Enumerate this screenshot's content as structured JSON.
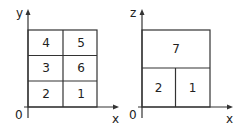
{
  "diagram": {
    "left_panel": {
      "vertical_axis_label": "y",
      "horizontal_axis_label": "x",
      "origin_label": "0",
      "cells": [
        {
          "label": "4",
          "row": 0,
          "col": 0
        },
        {
          "label": "5",
          "row": 0,
          "col": 1
        },
        {
          "label": "3",
          "row": 1,
          "col": 0
        },
        {
          "label": "6",
          "row": 1,
          "col": 1
        },
        {
          "label": "2",
          "row": 2,
          "col": 0
        },
        {
          "label": "1",
          "row": 2,
          "col": 1
        }
      ]
    },
    "right_panel": {
      "vertical_axis_label": "z",
      "horizontal_axis_label": "x",
      "origin_label": "0",
      "cells": [
        {
          "label": "7",
          "position": "top-full-width"
        },
        {
          "label": "2",
          "position": "bottom-left"
        },
        {
          "label": "1",
          "position": "bottom-right"
        }
      ]
    },
    "colors": {
      "line": "#333333",
      "text": "#222222",
      "background": "#ffffff"
    }
  }
}
